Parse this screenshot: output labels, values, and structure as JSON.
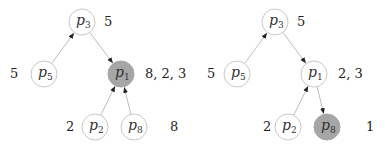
{
  "colors": {
    "node_fill": "#ffffff",
    "node_stroke": "#c8c8c8",
    "highlight_fill": "#a6a6a6",
    "edge": "#bdbdbd",
    "arrowhead": "#222222"
  },
  "trees": [
    {
      "nodes": [
        {
          "id": "p3",
          "base": "p",
          "sub": "3",
          "x": 82,
          "y": 22,
          "highlight": false,
          "annotation": "5",
          "ann_x": 104,
          "ann_y": 26
        },
        {
          "id": "p5",
          "base": "p",
          "sub": "5",
          "x": 44,
          "y": 74,
          "highlight": false,
          "annotation": "5",
          "ann_x": 10,
          "ann_y": 78
        },
        {
          "id": "p1",
          "base": "p",
          "sub": "1",
          "x": 121,
          "y": 74,
          "highlight": true,
          "annotation": "8, 2, 3",
          "ann_x": 145,
          "ann_y": 78
        },
        {
          "id": "p2",
          "base": "p",
          "sub": "2",
          "x": 95,
          "y": 127,
          "highlight": false,
          "annotation": "2",
          "ann_x": 66,
          "ann_y": 131
        },
        {
          "id": "p8",
          "base": "p",
          "sub": "8",
          "x": 134,
          "y": 127,
          "highlight": false,
          "annotation": "8",
          "ann_x": 170,
          "ann_y": 131
        }
      ],
      "edges": [
        {
          "from": "p5",
          "to": "p3"
        },
        {
          "from": "p3",
          "to": "p1"
        },
        {
          "from": "p2",
          "to": "p1"
        },
        {
          "from": "p8",
          "to": "p1"
        }
      ]
    },
    {
      "nodes": [
        {
          "id": "p3",
          "base": "p",
          "sub": "3",
          "x": 275,
          "y": 22,
          "highlight": false,
          "annotation": "5",
          "ann_x": 297,
          "ann_y": 26
        },
        {
          "id": "p5",
          "base": "p",
          "sub": "5",
          "x": 237,
          "y": 74,
          "highlight": false,
          "annotation": "5",
          "ann_x": 207,
          "ann_y": 78
        },
        {
          "id": "p1",
          "base": "p",
          "sub": "1",
          "x": 314,
          "y": 74,
          "highlight": false,
          "annotation": "2, 3",
          "ann_x": 338,
          "ann_y": 78
        },
        {
          "id": "p2",
          "base": "p",
          "sub": "2",
          "x": 288,
          "y": 127,
          "highlight": false,
          "annotation": "2",
          "ann_x": 263,
          "ann_y": 131
        },
        {
          "id": "p8",
          "base": "p",
          "sub": "8",
          "x": 327,
          "y": 127,
          "highlight": true,
          "annotation": "1",
          "ann_x": 366,
          "ann_y": 131
        }
      ],
      "edges": [
        {
          "from": "p5",
          "to": "p3"
        },
        {
          "from": "p3",
          "to": "p1"
        },
        {
          "from": "p2",
          "to": "p1"
        },
        {
          "from": "p1",
          "to": "p8"
        }
      ]
    }
  ]
}
